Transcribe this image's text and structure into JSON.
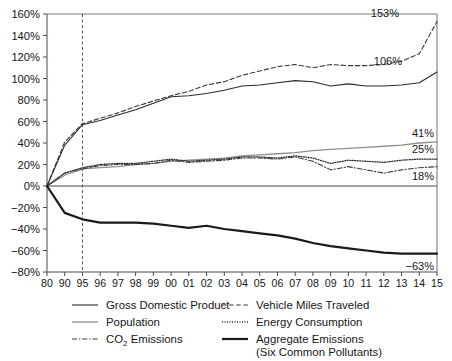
{
  "chart_data": {
    "type": "line",
    "title": "",
    "subtitle": "",
    "xlabel": "",
    "ylabel": "",
    "xlim": [
      1980,
      2015
    ],
    "ylim": [
      -80,
      160
    ],
    "y_tick_step": 20,
    "grid": false,
    "legend_position": "bottom",
    "y_tick_labels": [
      "160%",
      "140%",
      "120%",
      "100%",
      "80%",
      "60%",
      "40%",
      "20%",
      "0%",
      "−20%",
      "−40%",
      "−60%",
      "−80%"
    ],
    "y_tick_values": [
      160,
      140,
      120,
      100,
      80,
      60,
      40,
      20,
      0,
      -20,
      -40,
      -60,
      -80
    ],
    "x_tick_labels": [
      "80",
      "90",
      "95",
      "96",
      "97",
      "98",
      "99",
      "00",
      "01",
      "02",
      "03",
      "04",
      "05",
      "06",
      "07",
      "08",
      "09",
      "10",
      "11",
      "12",
      "13",
      "14",
      "15"
    ],
    "x_tick_values": [
      1980,
      1990,
      1995,
      1996,
      1997,
      1998,
      1999,
      2000,
      2001,
      2002,
      2003,
      2004,
      2005,
      2006,
      2007,
      2008,
      2009,
      2010,
      2011,
      2012,
      2013,
      2014,
      2015
    ],
    "annotations": [
      {
        "name": "reference-line-1995",
        "type": "vline",
        "x": 1995,
        "style": "dashed"
      }
    ],
    "end_labels": [
      {
        "series": "Vehicle Miles Traveled",
        "value": 153,
        "text": "153%"
      },
      {
        "series": "Gross Domestic Product",
        "value": 106,
        "text": "106%"
      },
      {
        "series": "Population",
        "value": 41,
        "text": "41%"
      },
      {
        "series": "Energy Consumption",
        "value": 25,
        "text": "25%"
      },
      {
        "series": "CO2 Emissions",
        "value": 18,
        "text": "18%"
      },
      {
        "series": "Aggregate Emissions (Six Common Pollutants)",
        "value": -63,
        "text": "−63%"
      }
    ],
    "series": [
      {
        "name": "Gross Domestic Product",
        "style": "solid-thin-dark",
        "color": "#2b2b2b",
        "x": [
          1980,
          1990,
          1995,
          1996,
          1997,
          1998,
          1999,
          2000,
          2001,
          2002,
          2003,
          2004,
          2005,
          2006,
          2007,
          2008,
          2009,
          2010,
          2011,
          2012,
          2013,
          2014,
          2015
        ],
        "values": [
          0,
          38,
          57,
          61,
          66,
          71,
          77,
          83,
          84,
          86,
          89,
          93,
          94,
          96,
          98,
          97,
          93,
          95,
          93,
          93,
          94,
          96,
          106
        ]
      },
      {
        "name": "Population",
        "style": "solid-thin-gray",
        "color": "#8a8a8a",
        "x": [
          1980,
          1990,
          1995,
          1996,
          1997,
          1998,
          1999,
          2000,
          2001,
          2002,
          2003,
          2004,
          2005,
          2006,
          2007,
          2008,
          2009,
          2010,
          2011,
          2012,
          2013,
          2014,
          2015
        ],
        "values": [
          0,
          10,
          16,
          17,
          18,
          20,
          21,
          23,
          24,
          25,
          26,
          28,
          29,
          30,
          31,
          33,
          34,
          35,
          36,
          37,
          38,
          40,
          41
        ]
      },
      {
        "name": "CO2 Emissions",
        "style": "dash-dot",
        "color": "#3a3a3a",
        "x": [
          1980,
          1990,
          1995,
          1996,
          1997,
          1998,
          1999,
          2000,
          2001,
          2002,
          2003,
          2004,
          2005,
          2006,
          2007,
          2008,
          2009,
          2010,
          2011,
          2012,
          2013,
          2014,
          2015
        ],
        "values": [
          0,
          12,
          16,
          19,
          20,
          20,
          21,
          24,
          22,
          23,
          24,
          26,
          26,
          25,
          27,
          23,
          15,
          18,
          15,
          12,
          15,
          17,
          18
        ]
      },
      {
        "name": "Vehicle Miles Traveled",
        "style": "dashed",
        "color": "#3a3a3a",
        "x": [
          1980,
          1990,
          1995,
          1996,
          1997,
          1998,
          1999,
          2000,
          2001,
          2002,
          2003,
          2004,
          2005,
          2006,
          2007,
          2008,
          2009,
          2010,
          2011,
          2012,
          2013,
          2014,
          2015
        ],
        "values": [
          0,
          41,
          58,
          63,
          68,
          74,
          79,
          84,
          88,
          94,
          97,
          103,
          107,
          111,
          113,
          110,
          113,
          112,
          112,
          113,
          116,
          123,
          153
        ]
      },
      {
        "name": "Energy Consumption",
        "style": "dotted",
        "color": "#2b2b2b",
        "x": [
          1980,
          1990,
          1995,
          1996,
          1997,
          1998,
          1999,
          2000,
          2001,
          2002,
          2003,
          2004,
          2005,
          2006,
          2007,
          2008,
          2009,
          2010,
          2011,
          2012,
          2013,
          2014,
          2015
        ],
        "values": [
          0,
          12,
          17,
          20,
          21,
          21,
          23,
          25,
          23,
          24,
          25,
          27,
          27,
          26,
          28,
          26,
          21,
          24,
          23,
          22,
          24,
          25,
          25
        ]
      },
      {
        "name": "Aggregate Emissions (Six Common Pollutants)",
        "style": "solid-thick",
        "color": "#1a1a1a",
        "x": [
          1980,
          1990,
          1995,
          1996,
          1997,
          1998,
          1999,
          2000,
          2001,
          2002,
          2003,
          2004,
          2005,
          2006,
          2007,
          2008,
          2009,
          2010,
          2011,
          2012,
          2013,
          2014,
          2015
        ],
        "values": [
          0,
          -25,
          -31,
          -34,
          -34,
          -34,
          -35,
          -37,
          -39,
          -37,
          -40,
          -42,
          -44,
          -46,
          -49,
          -53,
          -56,
          -58,
          -60,
          -62,
          -63,
          -63,
          -63
        ]
      }
    ]
  },
  "legend": {
    "items": [
      {
        "name": "gross-domestic-product",
        "label": "Gross Domestic Product",
        "style": "solid-thin-dark"
      },
      {
        "name": "vehicle-miles-traveled",
        "label": "Vehicle Miles Traveled",
        "style": "dashed"
      },
      {
        "name": "population",
        "label": "Population",
        "style": "solid-thin-gray"
      },
      {
        "name": "energy-consumption",
        "label": "Energy Consumption",
        "style": "dotted"
      },
      {
        "name": "co2-emissions",
        "label_pre": "CO",
        "label_sub": "2",
        "label_post": " Emissions",
        "style": "dash-dot"
      },
      {
        "name": "aggregate-emissions",
        "label": "Aggregate Emissions",
        "label_line2": "(Six Common Pollutants)",
        "style": "solid-thick"
      }
    ]
  },
  "colors": {
    "dark": "#2b2b2b",
    "gray": "#8a8a8a",
    "frame": "#7d7d7d",
    "axis": "#4a4a4a",
    "background": "#ffffff"
  }
}
